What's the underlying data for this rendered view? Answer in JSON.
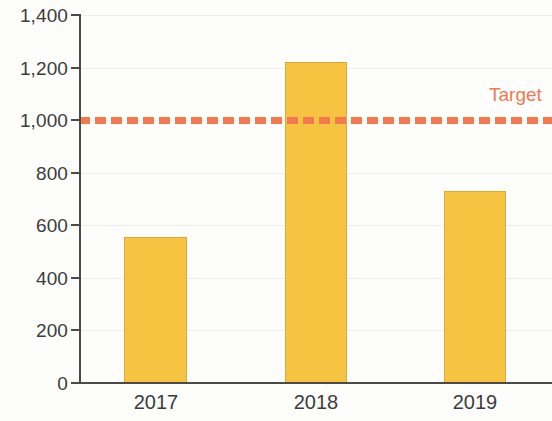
{
  "chart_data": {
    "type": "bar",
    "title": "",
    "subtitle": "",
    "xlabel": "",
    "ylabel": "",
    "categories": [
      "2017",
      "2018",
      "2019"
    ],
    "values": [
      555,
      1220,
      730
    ],
    "series": [
      {
        "name": "",
        "values": [
          555,
          1220,
          730
        ],
        "color": "#F6C441"
      }
    ],
    "ylim": [
      0,
      1400
    ],
    "ytick_values": [
      0,
      200,
      400,
      600,
      800,
      1000,
      1200,
      1400
    ],
    "ytick_labels": [
      "0",
      "200",
      "400",
      "600",
      "800",
      "1,000",
      "1,200",
      "1,400"
    ],
    "grid": true,
    "grid_axis": "y",
    "legend": "none",
    "annotations": [
      {
        "type": "hline",
        "label": "Target",
        "value": 1000,
        "style": "dashed",
        "color": "#F4794F",
        "label_position": "right-above"
      }
    ],
    "colors": {
      "bar_fill": "#F6C441",
      "bar_border": "#D9AB39",
      "target": "#F4794F",
      "axis": "#4A4A4A",
      "text": "#3C3C3C",
      "grid": "#EDEDEA",
      "background": "#FDFDFB"
    }
  },
  "axis": {
    "y_ticks": [
      {
        "label": "1,400",
        "value": 1400
      },
      {
        "label": "1,200",
        "value": 1200
      },
      {
        "label": "1,000",
        "value": 1000
      },
      {
        "label": "800",
        "value": 800
      },
      {
        "label": "600",
        "value": 600
      },
      {
        "label": "400",
        "value": 400
      },
      {
        "label": "200",
        "value": 200
      },
      {
        "label": "0",
        "value": 0
      }
    ],
    "x_ticks": [
      {
        "label": "2017"
      },
      {
        "label": "2018"
      },
      {
        "label": "2019"
      }
    ]
  },
  "target": {
    "label": "Target",
    "value": 1000
  }
}
